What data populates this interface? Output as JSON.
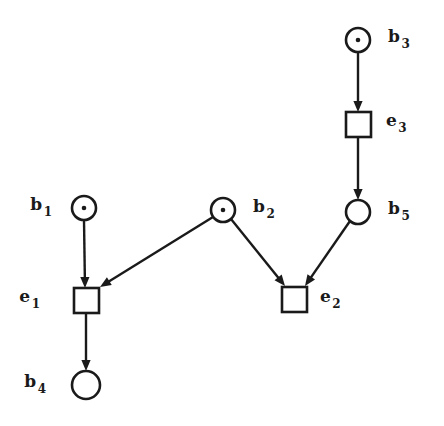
{
  "diagram": {
    "kind": "petri-net",
    "background_color": "#ffffff",
    "line_color": "#1a1a1a",
    "places": [
      {
        "id": "b1",
        "base": "b",
        "subscript": "1",
        "label": "b1",
        "cx": 84,
        "cy": 208,
        "r": 12,
        "tokens": 1,
        "label_x": 52,
        "label_y": 210,
        "label_side": "left"
      },
      {
        "id": "b2",
        "base": "b",
        "subscript": "2",
        "label": "b2",
        "cx": 223,
        "cy": 210,
        "r": 12,
        "tokens": 1,
        "label_x": 253,
        "label_y": 212,
        "label_side": "right"
      },
      {
        "id": "b3",
        "base": "b",
        "subscript": "3",
        "label": "b3",
        "cx": 358,
        "cy": 40,
        "r": 12,
        "tokens": 1,
        "label_x": 388,
        "label_y": 42,
        "label_side": "right"
      },
      {
        "id": "b4",
        "base": "b",
        "subscript": "4",
        "label": "b4",
        "cx": 86,
        "cy": 385,
        "r": 14,
        "tokens": 0,
        "label_x": 46,
        "label_y": 387,
        "label_side": "left"
      },
      {
        "id": "b5",
        "base": "b",
        "subscript": "5",
        "label": "b5",
        "cx": 358,
        "cy": 212,
        "r": 12,
        "tokens": 0,
        "label_x": 388,
        "label_y": 214,
        "label_side": "right"
      }
    ],
    "transitions": [
      {
        "id": "e1",
        "base": "e",
        "subscript": "1",
        "label": "e1",
        "x": 74,
        "y": 288,
        "w": 25,
        "h": 25,
        "label_x": 40,
        "label_y": 302,
        "label_side": "left"
      },
      {
        "id": "e2",
        "base": "e",
        "subscript": "2",
        "label": "e2",
        "x": 282,
        "y": 287,
        "w": 25,
        "h": 25,
        "label_x": 320,
        "label_y": 302,
        "label_side": "right"
      },
      {
        "id": "e3",
        "base": "e",
        "subscript": "3",
        "label": "e3",
        "x": 346,
        "y": 112,
        "w": 25,
        "h": 25,
        "label_x": 386,
        "label_y": 126,
        "label_side": "right"
      }
    ],
    "arcs": [
      {
        "id": "arc-b1-e1",
        "from": "b1",
        "to": "e1",
        "x1": 84,
        "y1": 220,
        "x2": 85,
        "y2": 288
      },
      {
        "id": "arc-b2-e1",
        "from": "b2",
        "to": "e1",
        "x1": 213,
        "y1": 217,
        "x2": 100,
        "y2": 287
      },
      {
        "id": "arc-e1-b4",
        "from": "e1",
        "to": "b4",
        "x1": 86,
        "y1": 313,
        "x2": 86,
        "y2": 371
      },
      {
        "id": "arc-b2-e2",
        "from": "b2",
        "to": "e2",
        "x1": 231,
        "y1": 219,
        "x2": 285,
        "y2": 286
      },
      {
        "id": "arc-b3-e3",
        "from": "b3",
        "to": "e3",
        "x1": 358,
        "y1": 52,
        "x2": 358,
        "y2": 112
      },
      {
        "id": "arc-e3-b5",
        "from": "e3",
        "to": "b5",
        "x1": 358,
        "y1": 137,
        "x2": 358,
        "y2": 200
      },
      {
        "id": "arc-b5-e2",
        "from": "b5",
        "to": "e2",
        "x1": 350,
        "y1": 221,
        "x2": 305,
        "y2": 286
      }
    ]
  }
}
